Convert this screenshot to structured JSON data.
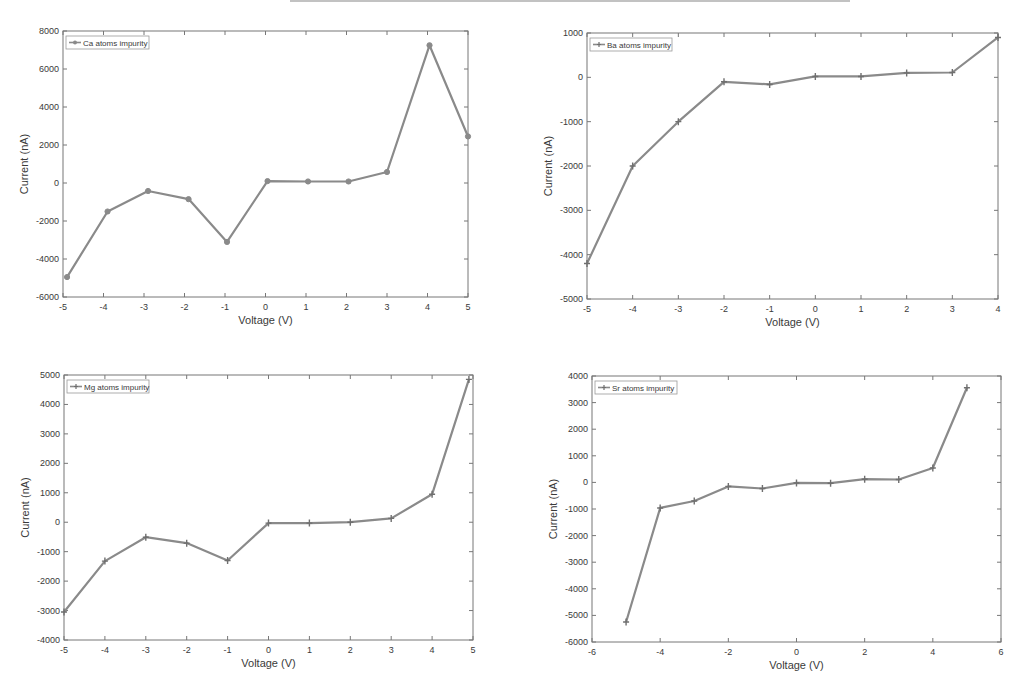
{
  "style": {
    "line_color": "#8a8a8a",
    "axis_color": "#777777",
    "text_color": "#3a3a3a",
    "background": "#ffffff"
  },
  "chart_data": [
    {
      "id": "ca",
      "type": "line",
      "title": "",
      "legend": "Ca atoms impurity",
      "legend_position": "upper-left",
      "marker": "circle",
      "xlabel": "Voltage (V)",
      "ylabel": "Current (nA)",
      "xlim": [
        -5,
        5
      ],
      "ylim": [
        -6000,
        8000
      ],
      "xticks": [
        -5,
        -4,
        -3,
        -2,
        -1,
        0,
        1,
        2,
        3,
        4,
        5
      ],
      "yticks": [
        -6000,
        -4000,
        -2000,
        0,
        2000,
        4000,
        6000,
        8000
      ],
      "grid": false,
      "x": [
        -4.9,
        -3.9,
        -2.9,
        -1.9,
        -0.95,
        0.05,
        1.05,
        2.05,
        3.0,
        4.05,
        5.0
      ],
      "y": [
        -4950,
        -1500,
        -420,
        -850,
        -3100,
        100,
        80,
        80,
        580,
        7250,
        2450
      ],
      "box": {
        "left": 63,
        "top": 31,
        "right": 468,
        "bottom": 297
      }
    },
    {
      "id": "ba",
      "type": "line",
      "title": "",
      "legend": "Ba atoms impurity",
      "legend_position": "upper-left",
      "marker": "plus",
      "xlabel": "Voltage (V)",
      "ylabel": "Current (nA)",
      "xlim": [
        -5,
        4
      ],
      "ylim": [
        -5000,
        1000
      ],
      "xticks": [
        -5,
        -4,
        -3,
        -2,
        -1,
        0,
        1,
        2,
        3,
        4
      ],
      "yticks": [
        -5000,
        -4000,
        -3000,
        -2000,
        -1000,
        0,
        1000
      ],
      "grid": false,
      "x": [
        -5,
        -4,
        -3,
        -2,
        -1,
        0,
        1,
        2,
        3,
        4
      ],
      "y": [
        -4200,
        -2000,
        -1000,
        -100,
        -160,
        20,
        20,
        100,
        110,
        900
      ],
      "box": {
        "left": 587,
        "top": 33,
        "right": 998,
        "bottom": 299
      }
    },
    {
      "id": "mg",
      "type": "line",
      "title": "",
      "legend": "Mg atoms impurity",
      "legend_position": "upper-left",
      "marker": "plus",
      "xlabel": "Voltage (V)",
      "ylabel": "Current (nA)",
      "xlim": [
        -5,
        5
      ],
      "ylim": [
        -4000,
        5000
      ],
      "xticks": [
        -5,
        -4,
        -3,
        -2,
        -1,
        0,
        1,
        2,
        3,
        4,
        5
      ],
      "yticks": [
        -4000,
        -3000,
        -2000,
        -1000,
        0,
        1000,
        2000,
        3000,
        4000,
        5000
      ],
      "grid": false,
      "x": [
        -5,
        -4,
        -3,
        -2,
        -1,
        0,
        1,
        2,
        3,
        4,
        4.9
      ],
      "y": [
        -3050,
        -1320,
        -510,
        -710,
        -1300,
        -30,
        -30,
        0,
        130,
        950,
        4850
      ],
      "box": {
        "left": 64,
        "top": 375,
        "right": 473,
        "bottom": 640
      }
    },
    {
      "id": "sr",
      "type": "line",
      "title": "",
      "legend": "Sr atoms impurity",
      "legend_position": "upper-left",
      "marker": "plus",
      "xlabel": "Voltage (V)",
      "ylabel": "Current (nA)",
      "xlim": [
        -6,
        6
      ],
      "ylim": [
        -6000,
        4000
      ],
      "xticks": [
        -6,
        -4,
        -2,
        0,
        2,
        4,
        6
      ],
      "yticks": [
        -6000,
        -5000,
        -4000,
        -3000,
        -2000,
        -1000,
        0,
        1000,
        2000,
        3000,
        4000
      ],
      "grid": false,
      "x": [
        -5,
        -4,
        -3,
        -2,
        -1,
        0,
        1,
        2,
        3,
        4,
        5
      ],
      "y": [
        -5250,
        -960,
        -700,
        -150,
        -230,
        -20,
        -30,
        120,
        110,
        540,
        3560
      ],
      "box": {
        "left": 592,
        "top": 376,
        "right": 1001,
        "bottom": 642
      }
    }
  ]
}
